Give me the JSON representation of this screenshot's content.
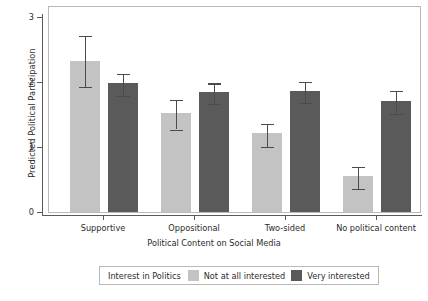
{
  "chart_data": {
    "type": "bar",
    "title": "",
    "xlabel": "Political Content on Social Media",
    "ylabel": "Predicted Political Participation",
    "categories": [
      "Supportive",
      "Oppositional",
      "Two-sided",
      "No political content"
    ],
    "ylim": [
      0,
      3
    ],
    "yticks": [
      "0",
      "1",
      "2",
      "3"
    ],
    "grid": false,
    "legend_position": "bottom",
    "legend_title": "Interest in Politics",
    "series": [
      {
        "name": "Not at all interested",
        "color": "#c3c3c3",
        "values": [
          2.32,
          1.52,
          1.22,
          0.55
        ],
        "ci_low": [
          1.96,
          1.3,
          1.03,
          0.38
        ],
        "ci_high": [
          2.74,
          1.76,
          1.38,
          0.73
        ]
      },
      {
        "name": "Very interested",
        "color": "#5a5a5a",
        "values": [
          1.99,
          1.85,
          1.86,
          1.71
        ],
        "ci_low": [
          1.82,
          1.7,
          1.71,
          1.54
        ],
        "ci_high": [
          2.16,
          2.01,
          2.03,
          1.9
        ]
      }
    ]
  },
  "legend": {
    "title": "Interest in Politics",
    "items": [
      {
        "label": "Not at all interested",
        "color": "#c3c3c3"
      },
      {
        "label": "Very interested",
        "color": "#5a5a5a"
      }
    ]
  }
}
